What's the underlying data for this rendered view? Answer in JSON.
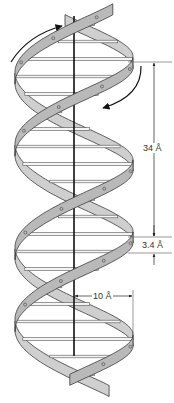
{
  "figure": {
    "labels": {
      "pitch": "34 Å",
      "rise": "3.4 Å",
      "radius": "10 Å"
    }
  },
  "geometry": {
    "axis_x": 74,
    "radius_px": 59,
    "pitch_px": 175,
    "top_y": 14,
    "bottom_y": 386,
    "strand_offset_deg": 180,
    "ribbon_width_px": 11,
    "base_pairs_per_turn": 10,
    "pitch_top_y": 62,
    "pitch_bottom_y": 237,
    "rise_bottom_y": 253,
    "dim_line_x": 154,
    "radius_dim_y": 296,
    "radius_dim_x2": 133
  },
  "colors": {
    "ribbon_fill": "#b9b9b9",
    "ribbon_back_fill": "#cfcfcf",
    "ribbon_edge": "#3a3a3a",
    "axis": "#111111",
    "rung_fill": "#f4f4f4",
    "rung_edge": "#555555",
    "dim_line": "#555555"
  },
  "arrows": [
    {
      "name": "rotation-arrow-top-left",
      "direction": "clockwise-up"
    },
    {
      "name": "rotation-arrow-right",
      "direction": "down-left"
    }
  ]
}
